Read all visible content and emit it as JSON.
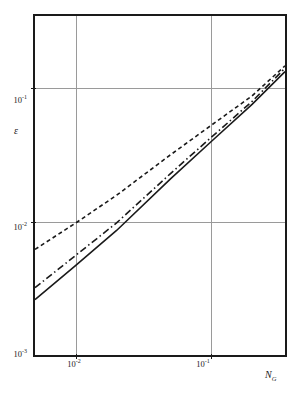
{
  "chart_data": {
    "type": "line",
    "title": "",
    "xlabel": "N_G",
    "ylabel": "e",
    "xscale": "log",
    "yscale": "log",
    "xlim": [
      0.005,
      0.35
    ],
    "ylim": [
      0.001,
      0.35
    ],
    "grid": true,
    "legend": "none",
    "x_ticks": [
      {
        "value": 0.01,
        "label": "10",
        "exponent": "-2"
      },
      {
        "value": 0.1,
        "label": "10",
        "exponent": "-1"
      }
    ],
    "y_ticks": [
      {
        "value": 0.001,
        "label": "10",
        "exponent": "-3"
      },
      {
        "value": 0.01,
        "label": "10",
        "exponent": "-2"
      },
      {
        "value": 0.1,
        "label": "10",
        "exponent": "-1"
      }
    ],
    "series": [
      {
        "name": "upper-curve",
        "style": "dotted",
        "color": "#1a1a1a",
        "x": [
          0.005,
          0.01,
          0.02,
          0.05,
          0.1,
          0.2,
          0.35
        ],
        "y": [
          0.0062,
          0.0098,
          0.0158,
          0.0318,
          0.053,
          0.088,
          0.148
        ]
      },
      {
        "name": "middle-curve",
        "style": "dash-dot",
        "color": "#1a1a1a",
        "x": [
          0.005,
          0.01,
          0.02,
          0.05,
          0.1,
          0.2,
          0.35
        ],
        "y": [
          0.0032,
          0.0056,
          0.0098,
          0.023,
          0.043,
          0.08,
          0.142
        ]
      },
      {
        "name": "lower-curve",
        "style": "solid",
        "color": "#1a1a1a",
        "x": [
          0.005,
          0.01,
          0.02,
          0.05,
          0.1,
          0.2,
          0.35
        ],
        "y": [
          0.0026,
          0.0047,
          0.0086,
          0.021,
          0.04,
          0.076,
          0.134
        ]
      }
    ]
  },
  "axis": {
    "y_title": "ε",
    "x_title_base": "N",
    "x_title_sub": "G"
  },
  "ticks": {
    "y": {
      "t1_mantissa": "10",
      "t1_exp": "-1",
      "t2_mantissa": "10",
      "t2_exp": "-2",
      "t3_mantissa": "10",
      "t3_exp": "-3"
    },
    "x": {
      "t1_mantissa": "10",
      "t1_exp": "-2",
      "t2_mantissa": "10",
      "t2_exp": "-1"
    }
  }
}
